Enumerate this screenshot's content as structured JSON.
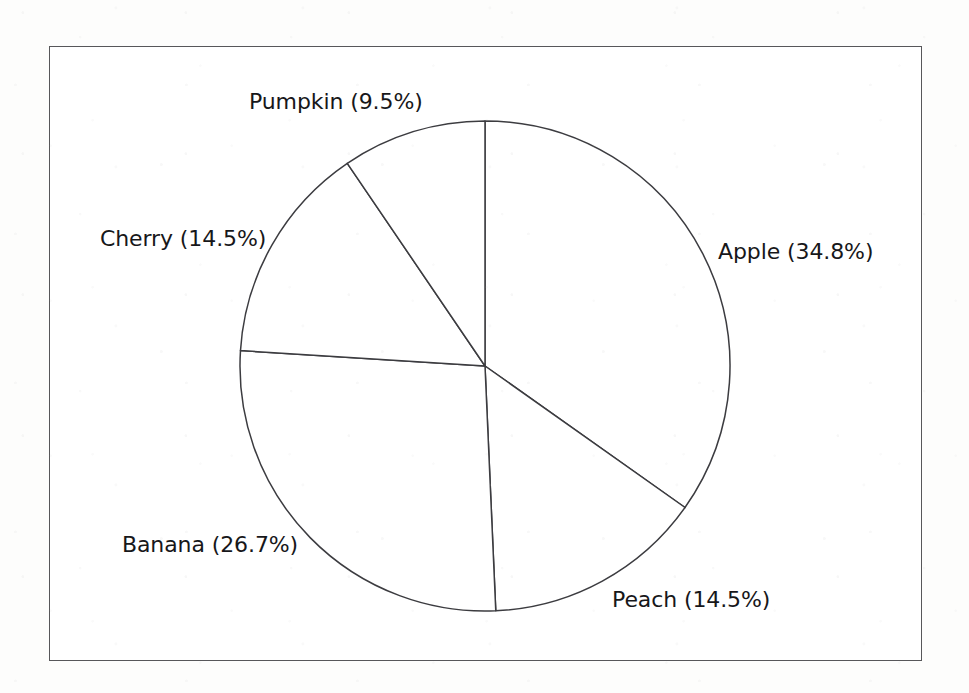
{
  "figure": {
    "background_color": "#fdfdfc",
    "panel_color": "#ffffff",
    "frame_color": "#57575a",
    "line_color": "#3c3c40",
    "text_color": "#17171a"
  },
  "chart_data": {
    "type": "pie",
    "title": "",
    "subtitle": "",
    "xlabel": "",
    "ylabel": "",
    "grid": false,
    "legend": "none",
    "labels_position": "outside-edge",
    "start_angle_deg": 90,
    "direction": "clockwise",
    "center_px": [
      485,
      366
    ],
    "radius_px": 245,
    "categories": [
      "Apple",
      "Peach",
      "Banana",
      "Cherry",
      "Pumpkin"
    ],
    "values": [
      34.8,
      14.5,
      26.7,
      14.5,
      9.5
    ],
    "value_unit": "%",
    "slices": [
      {
        "name": "Apple",
        "value": 34.8,
        "label": "Apple (34.8%)",
        "sweep_deg": 125.28,
        "start_deg": 0.0,
        "end_deg": 125.28,
        "color": "#ffffff",
        "label_x": 718,
        "label_y": 241
      },
      {
        "name": "Peach",
        "value": 14.5,
        "label": "Peach (14.5%)",
        "sweep_deg": 52.2,
        "start_deg": 125.28,
        "end_deg": 177.48,
        "color": "#ffffff",
        "label_x": 612,
        "label_y": 589
      },
      {
        "name": "Banana",
        "value": 26.7,
        "label": "Banana (26.7%)",
        "sweep_deg": 96.12,
        "start_deg": 177.48,
        "end_deg": 273.6,
        "color": "#ffffff",
        "label_x": 122,
        "label_y": 534
      },
      {
        "name": "Cherry",
        "value": 14.5,
        "label": "Cherry (14.5%)",
        "sweep_deg": 52.2,
        "start_deg": 273.6,
        "end_deg": 325.8,
        "color": "#ffffff",
        "label_x": 100,
        "label_y": 228
      },
      {
        "name": "Pumpkin",
        "value": 9.5,
        "label": "Pumpkin (9.5%)",
        "sweep_deg": 34.2,
        "start_deg": 325.8,
        "end_deg": 360.0,
        "color": "#ffffff",
        "label_x": 249,
        "label_y": 91
      }
    ],
    "total": 100.0
  }
}
